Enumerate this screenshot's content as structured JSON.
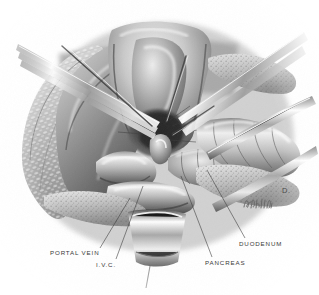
{
  "figure": {
    "type": "surgical anatomical illustration",
    "style": "graphite / carbon-dust medical illustration, grayscale",
    "background_color": "#ffffff",
    "ink_color": "#3a3a3a",
    "artist_signature_present": true,
    "panel_letter": "D."
  },
  "labels": [
    {
      "id": "portal-vein",
      "text": "PORTAL VEIN",
      "x": 50,
      "y": 250,
      "leader": {
        "x1": 100,
        "y1": 248,
        "x2": 130,
        "y2": 198
      }
    },
    {
      "id": "ivc",
      "text": "I.V.C.",
      "x": 96,
      "y": 262,
      "leader": {
        "x1": 116,
        "y1": 259,
        "x2": 143,
        "y2": 186
      }
    },
    {
      "id": "pancreas",
      "text": "PANCREAS",
      "x": 205,
      "y": 260,
      "leader": {
        "x1": 212,
        "y1": 257,
        "x2": 181,
        "y2": 176
      }
    },
    {
      "id": "duodenum",
      "text": "DUODENUM",
      "x": 239,
      "y": 241,
      "leader": {
        "x1": 245,
        "y1": 238,
        "x2": 207,
        "y2": 170
      }
    }
  ],
  "panel_mark": {
    "text": "D.",
    "x": 282,
    "y": 186
  },
  "structures": [
    "liver retracted superiorly",
    "common bile duct",
    "portal vein",
    "inferior vena cava",
    "pancreas head",
    "duodenum (Kocherized)",
    "retroperitoneal fat",
    "surgical retractors",
    "dissecting forceps"
  ]
}
